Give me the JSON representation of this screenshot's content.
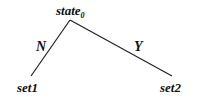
{
  "diagram": {
    "type": "decision-tree",
    "root": {
      "label": "state",
      "subscript": "0"
    },
    "edges": [
      {
        "label": "N",
        "from": "state0",
        "to": "set1"
      },
      {
        "label": "Y",
        "from": "state0",
        "to": "set2"
      }
    ],
    "leaves": [
      {
        "label": "set1"
      },
      {
        "label": "set2"
      }
    ],
    "line_color": "#222222"
  }
}
